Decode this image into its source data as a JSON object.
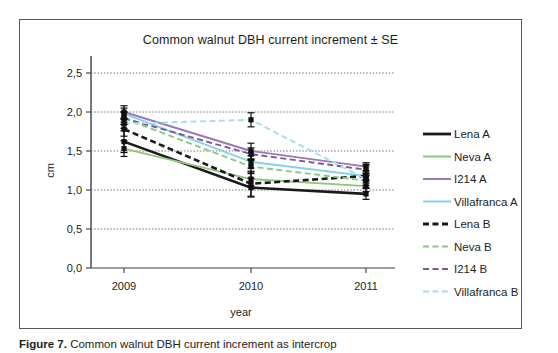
{
  "figure": {
    "caption_label": "Figure 7.",
    "caption_text": "   Common walnut DBH current increment as intercrop"
  },
  "chart_data": {
    "type": "line",
    "title": "Common walnut DBH current increment ± SE",
    "xlabel": "year",
    "ylabel": "cm",
    "categories": [
      "2009",
      "2010",
      "2011"
    ],
    "x_tick_labels": [
      "2009",
      "2010",
      "2011"
    ],
    "y_tick_labels": [
      "0,0",
      "0,5",
      "1,0",
      "1,5",
      "2,0",
      "2,5"
    ],
    "y_tick_values": [
      0.0,
      0.5,
      1.0,
      1.5,
      2.0,
      2.5
    ],
    "ylim": [
      0.0,
      2.5
    ],
    "grid": "horizontal",
    "legend_position": "right",
    "error_bars": "SE",
    "series": [
      {
        "name": "Lena A",
        "color": "#1a1a1a",
        "style": "solid",
        "values": [
          1.62,
          1.03,
          0.95
        ],
        "errors": [
          0.14,
          0.12,
          0.07
        ]
      },
      {
        "name": "Neva A",
        "color": "#8dc87f",
        "style": "solid",
        "values": [
          1.53,
          1.14,
          1.05
        ],
        "errors": [
          0.1,
          0.09,
          0.07
        ]
      },
      {
        "name": "I214 A",
        "color": "#9a77b5",
        "style": "solid",
        "values": [
          2.0,
          1.5,
          1.3
        ],
        "errors": [
          0.08,
          0.1,
          0.05
        ]
      },
      {
        "name": "Villafranca A",
        "color": "#86d0ef",
        "style": "solid",
        "values": [
          1.98,
          1.36,
          1.18
        ],
        "errors": [
          0.07,
          0.08,
          0.05
        ]
      },
      {
        "name": "Lena B",
        "color": "#1a1a1a",
        "style": "dashed",
        "values": [
          1.78,
          1.08,
          1.18
        ],
        "errors": [
          0.09,
          0.16,
          0.15
        ]
      },
      {
        "name": "Neva B",
        "color": "#8dc87f",
        "style": "dashed",
        "values": [
          1.92,
          1.3,
          1.12
        ],
        "errors": [
          0.08,
          0.09,
          0.06
        ]
      },
      {
        "name": "I214 B",
        "color": "#7a5a94",
        "style": "dashed",
        "values": [
          1.92,
          1.46,
          1.26
        ],
        "errors": [
          0.08,
          0.08,
          0.05
        ]
      },
      {
        "name": "Villafranca B",
        "color": "#a6dcf2",
        "style": "dashed",
        "values": [
          1.85,
          1.9,
          1.14
        ],
        "errors": [
          0.06,
          0.09,
          0.05
        ]
      }
    ]
  }
}
